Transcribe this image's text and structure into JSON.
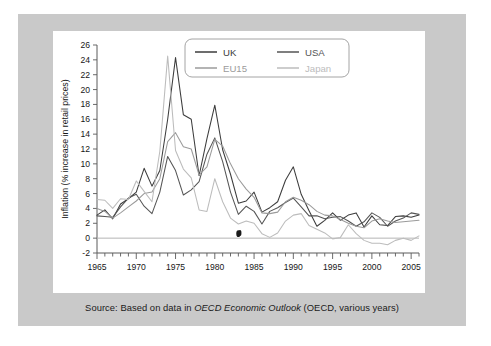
{
  "figure": {
    "caption_prefix": "Source: Based on data in ",
    "caption_italic": "OECD Economic Outlook",
    "caption_suffix": " (OECD, various years)"
  },
  "colors": {
    "uk": "#3c3c3c",
    "usa": "#555555",
    "eu15": "#9b9b9b",
    "japan": "#bcbcbc",
    "axis": "#5a5a5a",
    "zeroline": "#b4b4b4",
    "panel": "#c9c9c9",
    "plot_background": "#ffffff"
  },
  "chart_data": {
    "type": "line",
    "title": "",
    "xlabel": "",
    "ylabel": "Inflation (% increase in retail prices)",
    "xlim": [
      1965,
      2006
    ],
    "ylim": [
      -2,
      26
    ],
    "ytick_step": 2,
    "yticks": [
      -2,
      0,
      2,
      4,
      6,
      8,
      10,
      12,
      14,
      16,
      18,
      20,
      22,
      24,
      26
    ],
    "xticks_labeled": [
      1965,
      1970,
      1975,
      1980,
      1985,
      1990,
      1995,
      2000,
      2005
    ],
    "xtick_minor_step": 1,
    "grid": false,
    "legend_position": "top-center",
    "x": [
      1965,
      1966,
      1967,
      1968,
      1969,
      1970,
      1971,
      1972,
      1973,
      1974,
      1975,
      1976,
      1977,
      1978,
      1979,
      1980,
      1981,
      1982,
      1983,
      1984,
      1985,
      1986,
      1987,
      1988,
      1989,
      1990,
      1991,
      1992,
      1993,
      1994,
      1995,
      1996,
      1997,
      1998,
      1999,
      2000,
      2001,
      2002,
      2003,
      2004,
      2005,
      2006
    ],
    "series": [
      {
        "name": "UK",
        "color": "#3c3c3c",
        "values": [
          3.1,
          3.8,
          2.6,
          4.6,
          5.3,
          6.2,
          9.4,
          7.0,
          9.1,
          16.0,
          24.3,
          16.6,
          16.0,
          8.4,
          13.4,
          17.9,
          11.9,
          8.6,
          4.7,
          5.0,
          6.2,
          3.5,
          4.1,
          4.9,
          7.8,
          9.6,
          5.9,
          3.7,
          1.6,
          2.4,
          3.4,
          2.4,
          3.1,
          3.4,
          1.5,
          3.0,
          1.8,
          1.7,
          2.9,
          3.0,
          2.8,
          3.1
        ]
      },
      {
        "name": "USA",
        "color": "#555555",
        "values": [
          3.0,
          2.9,
          2.8,
          4.2,
          5.4,
          5.9,
          4.3,
          3.3,
          6.2,
          11.0,
          9.1,
          5.8,
          6.5,
          7.6,
          11.3,
          13.5,
          10.3,
          6.2,
          3.2,
          4.3,
          3.6,
          1.9,
          3.6,
          4.1,
          4.8,
          5.4,
          4.2,
          3.0,
          3.0,
          2.6,
          2.8,
          2.9,
          2.3,
          1.6,
          2.2,
          3.4,
          2.8,
          1.6,
          2.3,
          2.7,
          3.4,
          3.2
        ]
      },
      {
        "name": "EU15",
        "color": "#9b9b9b",
        "values": [
          4.0,
          3.6,
          2.7,
          3.4,
          4.2,
          5.0,
          6.0,
          6.2,
          8.0,
          13.0,
          14.2,
          12.3,
          12.0,
          8.5,
          9.6,
          13.3,
          12.4,
          10.0,
          8.0,
          6.6,
          5.5,
          3.4,
          3.3,
          3.5,
          4.9,
          5.5,
          5.1,
          4.5,
          3.6,
          3.1,
          3.0,
          2.5,
          2.0,
          1.6,
          1.4,
          2.3,
          2.6,
          2.3,
          2.1,
          2.2,
          2.3,
          2.4
        ]
      },
      {
        "name": "Japan",
        "color": "#bcbcbc",
        "values": [
          5.2,
          5.1,
          4.0,
          5.3,
          5.2,
          7.7,
          6.3,
          4.9,
          11.7,
          24.5,
          11.8,
          9.3,
          8.1,
          3.8,
          3.6,
          8.0,
          4.9,
          2.7,
          1.9,
          2.3,
          2.0,
          0.6,
          0.1,
          0.7,
          2.3,
          3.1,
          3.3,
          1.7,
          1.2,
          0.7,
          -0.1,
          0.1,
          1.8,
          0.6,
          -0.3,
          -0.7,
          -0.7,
          -0.9,
          -0.3,
          0.0,
          -0.3,
          0.3
        ]
      }
    ],
    "annotations": [
      {
        "name": "ink-smudge",
        "x": 1983,
        "y": 0.6
      }
    ],
    "legend": [
      {
        "label": "UK",
        "color": "#3c3c3c"
      },
      {
        "label": "USA",
        "color": "#555555"
      },
      {
        "label": "EU15",
        "color": "#9b9b9b"
      },
      {
        "label": "Japan",
        "color": "#bcbcbc"
      }
    ]
  }
}
